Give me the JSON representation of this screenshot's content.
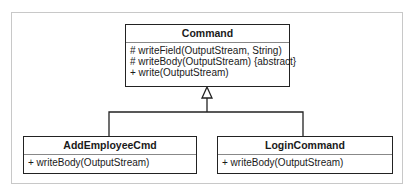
{
  "diagram": {
    "type": "uml-class-diagram",
    "classes": [
      {
        "name": "Command",
        "operations": [
          "# writeField(OutputStream, String)",
          "# writeBody(OutputStream) {abstract}",
          "+ write(OutputStream)"
        ]
      },
      {
        "name": "AddEmployeeCmd",
        "operations": [
          "+ writeBody(OutputStream)"
        ]
      },
      {
        "name": "LoginCommand",
        "operations": [
          "+ writeBody(OutputStream)"
        ]
      }
    ],
    "relationships": [
      {
        "type": "generalization",
        "from": "AddEmployeeCmd",
        "to": "Command"
      },
      {
        "type": "generalization",
        "from": "LoginCommand",
        "to": "Command"
      }
    ],
    "colors": {
      "border": "#222222",
      "frame": "#c8c8c8",
      "background": "#ffffff"
    }
  }
}
